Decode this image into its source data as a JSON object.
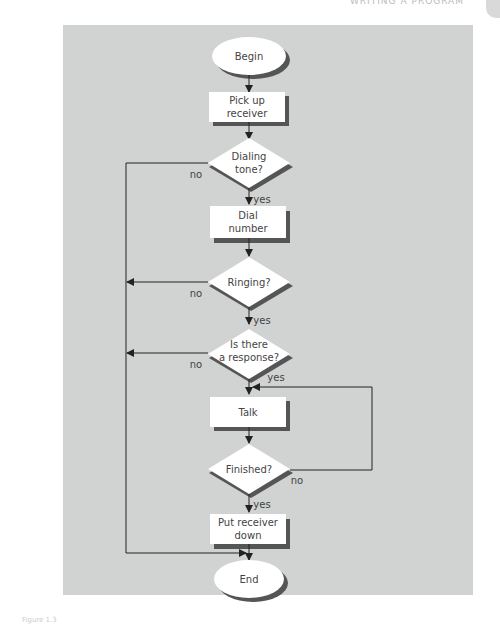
{
  "header": {
    "running_title": "WRITING A PROGRAM"
  },
  "caption": {
    "text": "Figure 1.3"
  },
  "flowchart": {
    "nodes": [
      {
        "id": "begin",
        "type": "terminal",
        "lines": [
          "Begin"
        ]
      },
      {
        "id": "pickup",
        "type": "process",
        "lines": [
          "Pick up",
          "receiver"
        ]
      },
      {
        "id": "dialtone",
        "type": "decision",
        "lines": [
          "Dialing",
          "tone?"
        ]
      },
      {
        "id": "dial",
        "type": "process",
        "lines": [
          "Dial",
          "number"
        ]
      },
      {
        "id": "ringing",
        "type": "decision",
        "lines": [
          "Ringing?"
        ]
      },
      {
        "id": "response",
        "type": "decision",
        "lines": [
          "Is there",
          "a response?"
        ]
      },
      {
        "id": "talk",
        "type": "process",
        "lines": [
          "Talk"
        ]
      },
      {
        "id": "finished",
        "type": "decision",
        "lines": [
          "Finished?"
        ]
      },
      {
        "id": "putdown",
        "type": "process",
        "lines": [
          "Put receiver",
          "down"
        ]
      },
      {
        "id": "end",
        "type": "terminal",
        "lines": [
          "End"
        ]
      }
    ],
    "labels": {
      "dialtone_yes": "yes",
      "dialtone_no": "no",
      "ringing_yes": "yes",
      "ringing_no": "no",
      "response_yes": "yes",
      "response_no": "no",
      "finished_yes": "yes",
      "finished_no": "no"
    }
  },
  "colors": {
    "panel": "#d0d3d2",
    "shape_fill": "#ffffff",
    "shadow": "#555555",
    "line": "#333333",
    "text": "#444444"
  }
}
